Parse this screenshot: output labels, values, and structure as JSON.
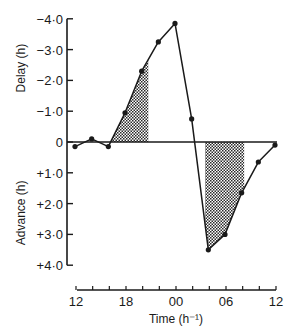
{
  "chart_data": {
    "type": "line",
    "title": "",
    "xlabel": "Time (h⁻¹)",
    "ylabel_top": "Delay (h)",
    "ylabel_bottom": "Advance (h)",
    "x_tick_labels": [
      "12",
      "18",
      "00",
      "06",
      "12"
    ],
    "x_tick_hours": [
      0,
      6,
      12,
      18,
      24
    ],
    "x_minor_tick_every_h": 2,
    "y_ticks": [
      {
        "value": -4,
        "label": "−4·0"
      },
      {
        "value": -3,
        "label": "−3·0"
      },
      {
        "value": -2,
        "label": "−2·0"
      },
      {
        "value": -1,
        "label": "−1·0"
      },
      {
        "value": 0,
        "label": "0"
      },
      {
        "value": 1,
        "label": "+1·0"
      },
      {
        "value": 2,
        "label": "+2·0"
      },
      {
        "value": 3,
        "label": "+3·0"
      },
      {
        "value": 4,
        "label": "+4·0"
      }
    ],
    "ylim": [
      -4,
      4
    ],
    "y_inverted_note": "negative (delay) plotted upward, positive (advance) downward",
    "x": [
      "12",
      "14",
      "16",
      "18",
      "20",
      "22",
      "00",
      "02",
      "04",
      "06",
      "08",
      "10",
      "12"
    ],
    "x_hours": [
      0,
      2,
      4,
      6,
      8,
      10,
      12,
      14,
      16,
      18,
      20,
      22,
      24
    ],
    "series": [
      {
        "name": "Phase shift",
        "values": [
          0.15,
          -0.1,
          0.15,
          -0.95,
          -2.3,
          -3.25,
          -3.85,
          -0.75,
          3.5,
          3.0,
          1.65,
          0.65,
          0.1
        ]
      }
    ],
    "shaded_regions": [
      {
        "name": "delay-region",
        "x_start_h": 4.4,
        "x_end_h": 8.8,
        "side": "delay"
      },
      {
        "name": "advance-region",
        "x_start_h": 15.6,
        "x_end_h": 20.3,
        "side": "advance"
      }
    ],
    "grid": false,
    "legend": null
  }
}
